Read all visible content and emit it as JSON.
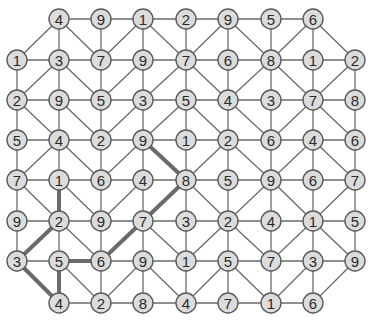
{
  "puzzle": {
    "type": "number-path-grid",
    "columns_x": [
      17,
      59,
      101,
      143,
      186,
      228,
      271,
      313,
      355
    ],
    "rows_y": [
      19,
      60,
      100,
      140,
      180,
      221,
      261,
      303
    ],
    "node_radius": 10,
    "grid": [
      [
        null,
        4,
        9,
        1,
        2,
        9,
        5,
        6,
        null
      ],
      [
        1,
        3,
        7,
        9,
        7,
        6,
        8,
        1,
        2
      ],
      [
        2,
        9,
        5,
        3,
        5,
        4,
        3,
        7,
        8
      ],
      [
        5,
        4,
        2,
        9,
        1,
        2,
        6,
        4,
        6
      ],
      [
        7,
        1,
        6,
        4,
        8,
        5,
        9,
        6,
        7
      ],
      [
        9,
        2,
        9,
        7,
        3,
        2,
        4,
        1,
        5
      ],
      [
        3,
        5,
        6,
        9,
        1,
        5,
        7,
        3,
        9
      ],
      [
        null,
        4,
        2,
        8,
        4,
        7,
        1,
        6,
        null
      ]
    ],
    "diagonals": [
      [
        "/",
        "\\",
        "/",
        "\\",
        "/",
        "\\",
        "/",
        "\\"
      ],
      [
        "/",
        "\\",
        "/",
        "/",
        "\\",
        "/",
        "\\",
        "/"
      ],
      [
        "\\",
        "\\",
        "/",
        "/",
        "\\",
        "\\",
        "/",
        "\\"
      ],
      [
        "/",
        "\\",
        "/",
        "\\",
        "/",
        "\\",
        "/",
        "\\"
      ],
      [
        "\\",
        "\\",
        "/",
        "/",
        "\\",
        "/",
        "\\",
        "/"
      ],
      [
        "/",
        "\\",
        "/",
        "\\",
        "/",
        "\\",
        "/",
        "\\"
      ],
      [
        "\\",
        "\\",
        "/",
        "\\",
        "/",
        "\\",
        "/",
        "/"
      ]
    ],
    "highlighted_path": {
      "color": "#6b6b6b",
      "sequence_values": [
        9,
        8,
        7,
        6,
        5,
        4,
        3,
        2,
        1
      ],
      "nodes": [
        [
          3,
          3
        ],
        [
          4,
          4
        ],
        [
          5,
          3
        ],
        [
          6,
          2
        ],
        [
          6,
          1
        ],
        [
          7,
          1
        ],
        [
          6,
          0
        ],
        [
          5,
          1
        ],
        [
          4,
          1
        ]
      ]
    },
    "colors": {
      "node_fill": "#dcdcdc",
      "node_stroke": "#5a5a5a",
      "edge": "#6a6a6a",
      "text": "#2a2a2a",
      "background": "#ffffff"
    }
  }
}
